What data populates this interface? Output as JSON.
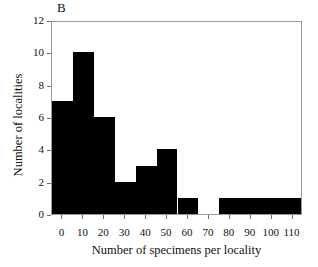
{
  "panel": {
    "label": "B"
  },
  "chart_data": {
    "type": "bar",
    "title": "B",
    "xlabel": "Number of specimens per locality",
    "ylabel": "Number of localities",
    "xlim": [
      -5,
      115
    ],
    "ylim": [
      0,
      12
    ],
    "grid": false,
    "legend": null,
    "bin_width": 10,
    "bin_edges": [
      -5,
      5,
      15,
      25,
      35,
      45,
      55,
      65,
      75,
      85,
      95,
      105,
      115
    ],
    "categories": [
      "-5 to 5",
      "5 to 15",
      "15 to 25",
      "25 to 35",
      "35 to 45",
      "45 to 55",
      "55 to 65",
      "65 to 75",
      "75 to 85",
      "85 to 95",
      "95 to 105",
      "105 to 115"
    ],
    "bin_centers": [
      0,
      10,
      20,
      30,
      40,
      50,
      60,
      70,
      80,
      90,
      100,
      110
    ],
    "values": [
      7,
      10,
      6,
      2,
      3,
      4,
      1,
      0,
      1,
      1,
      1,
      1
    ],
    "bar_color": "#000000",
    "xticks": [
      0,
      10,
      20,
      30,
      40,
      50,
      60,
      70,
      80,
      90,
      100,
      110
    ],
    "xtick_labels": [
      "0",
      "10",
      "20",
      "30",
      "40",
      "50",
      "60",
      "70",
      "80",
      "90",
      "100",
      "110"
    ],
    "yticks": [
      0,
      2,
      4,
      6,
      8,
      10,
      12
    ],
    "ytick_labels": [
      "0",
      "2",
      "4",
      "6",
      "8",
      "10",
      "12"
    ]
  }
}
